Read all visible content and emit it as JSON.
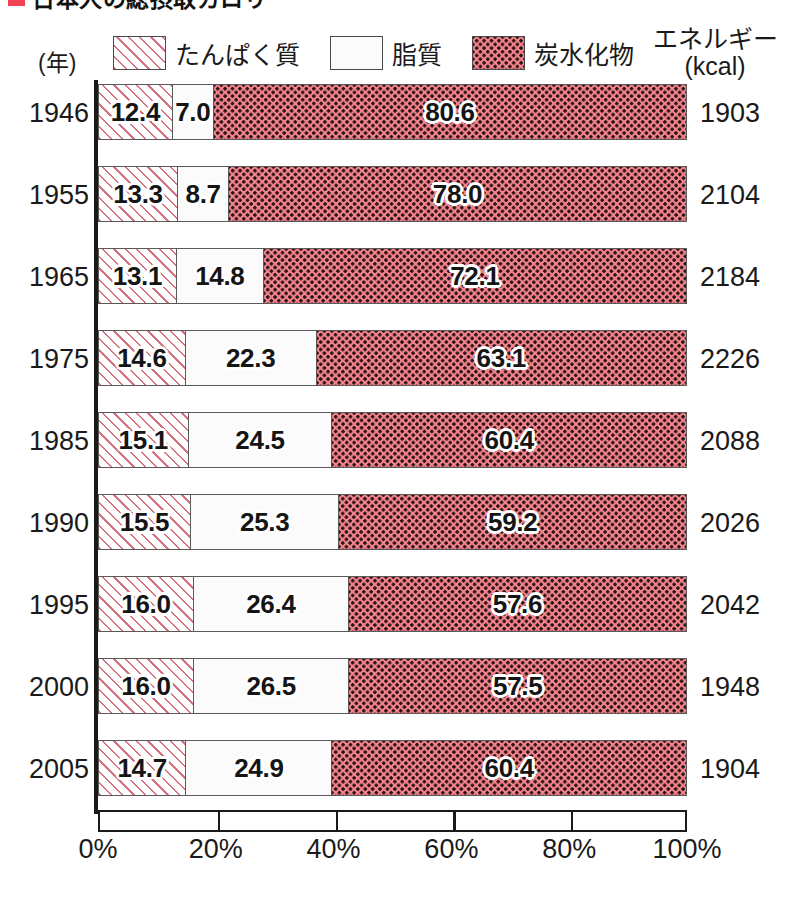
{
  "title": {
    "text": "日本人の総摂取カロリー",
    "marker_color": "#ef4355"
  },
  "axis_headers": {
    "year_label": "(年)",
    "energy_label_line1": "エネルギー",
    "energy_label_line2": "(kcal)"
  },
  "legend": {
    "items": [
      {
        "label": "たんぱく質",
        "pattern": "diagonal-hatch",
        "color": "#d4737f"
      },
      {
        "label": "脂質",
        "pattern": "solid-white",
        "color": "#ffffff"
      },
      {
        "label": "炭水化物",
        "pattern": "dotted",
        "color": "#f2828a"
      }
    ]
  },
  "chart_data": {
    "type": "bar",
    "title": "日本人の総摂取カロリー",
    "orientation": "horizontal",
    "stacked": true,
    "normalized_percent": true,
    "xlabel": "",
    "ylabel": "(年)",
    "xlim": [
      0,
      100
    ],
    "grid": false,
    "legend_position": "top",
    "categories": [
      "1946",
      "1955",
      "1965",
      "1975",
      "1985",
      "1990",
      "1995",
      "2000",
      "2005"
    ],
    "series": [
      {
        "name": "たんぱく質",
        "values": [
          12.4,
          13.3,
          13.1,
          14.6,
          15.1,
          15.5,
          16.0,
          16.0,
          14.7
        ]
      },
      {
        "name": "脂質",
        "values": [
          7.0,
          8.7,
          14.8,
          22.3,
          24.5,
          25.3,
          26.4,
          26.5,
          24.9
        ]
      },
      {
        "name": "炭水化物",
        "values": [
          80.6,
          78.0,
          72.1,
          63.1,
          60.4,
          59.2,
          57.6,
          57.5,
          60.4
        ]
      }
    ],
    "secondary_axis": {
      "name": "エネルギー (kcal)",
      "values": [
        1903,
        2104,
        2184,
        2226,
        2088,
        2026,
        2042,
        1948,
        1904
      ]
    },
    "xticks": [
      0,
      20,
      40,
      60,
      80,
      100
    ],
    "xticklabels": [
      "0%",
      "20%",
      "40%",
      "60%",
      "80%",
      "100%"
    ]
  },
  "rows": [
    {
      "year": "1946",
      "protein": "12.4",
      "fat": "7.0",
      "carb": "80.6",
      "energy": "1903"
    },
    {
      "year": "1955",
      "protein": "13.3",
      "fat": "8.7",
      "carb": "78.0",
      "energy": "2104"
    },
    {
      "year": "1965",
      "protein": "13.1",
      "fat": "14.8",
      "carb": "72.1",
      "energy": "2184"
    },
    {
      "year": "1975",
      "protein": "14.6",
      "fat": "22.3",
      "carb": "63.1",
      "energy": "2226"
    },
    {
      "year": "1985",
      "protein": "15.1",
      "fat": "24.5",
      "carb": "60.4",
      "energy": "2088"
    },
    {
      "year": "1990",
      "protein": "15.5",
      "fat": "25.3",
      "carb": "59.2",
      "energy": "2026"
    },
    {
      "year": "1995",
      "protein": "16.0",
      "fat": "26.4",
      "carb": "57.6",
      "energy": "2042"
    },
    {
      "year": "2000",
      "protein": "16.0",
      "fat": "26.5",
      "carb": "57.5",
      "energy": "1948"
    },
    {
      "year": "2005",
      "protein": "14.7",
      "fat": "24.9",
      "carb": "60.4",
      "energy": "1904"
    }
  ]
}
